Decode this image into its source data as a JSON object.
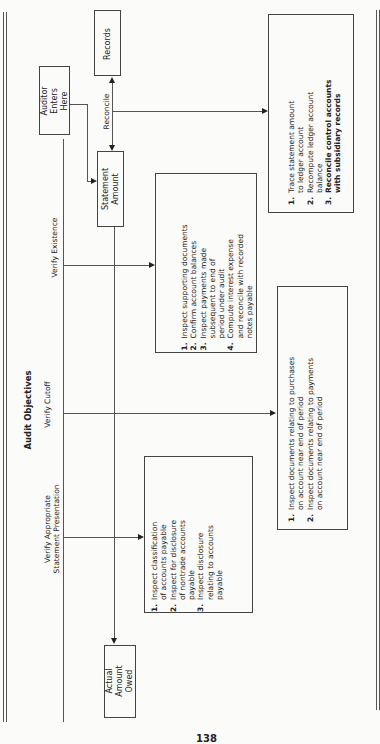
{
  "title": "Audit Objectives",
  "nodes": {
    "auditor": "Auditor\nEnters\nHere",
    "records": "Records",
    "statement_amount": "Statement\nAmount",
    "actual_amount_owed": "Actual\nAmount\nOwed"
  },
  "objectives": {
    "reconcile": "Reconcile",
    "existence": "Verify Existence",
    "cutoff": "Verify Cutoff",
    "presentation": "Verify Appropriate\nStatement Presentation"
  },
  "procedures": {
    "reconcile": [
      {
        "num": "1.",
        "text": "Trace statement amount\nto ledger account"
      },
      {
        "num": "2.",
        "text": "Recompute ledger account\nbalance"
      },
      {
        "num": "3.",
        "text": "Reconcile control accounts\nwith subsidiary records"
      }
    ],
    "existence": [
      {
        "num": "1.",
        "text": "Inspect supporting documents"
      },
      {
        "num": "2.",
        "text": "Confirm account balances"
      },
      {
        "num": "3.",
        "text": "Inspect payments made\nsubsequent to end of\nperiod under audit"
      },
      {
        "num": "4.",
        "text": "Compute interest expense\nand reconcile with recorded\nnotes payable"
      }
    ],
    "cutoff": [
      {
        "num": "1.",
        "text": "Inspect documents relating to purchases\non account near end of period"
      },
      {
        "num": "2.",
        "text": "Inspect documents relating to payments\non account near end of period"
      }
    ],
    "presentation": [
      {
        "num": "1.",
        "text": "Inspect classification\nof accounts payable"
      },
      {
        "num": "2.",
        "text": "Inspect for disclosure\nof nontrade accounts\npayable"
      },
      {
        "num": "3.",
        "text": "Inspect disclosure\nrelating to accounts\npayable"
      }
    ]
  },
  "page_number": "138"
}
